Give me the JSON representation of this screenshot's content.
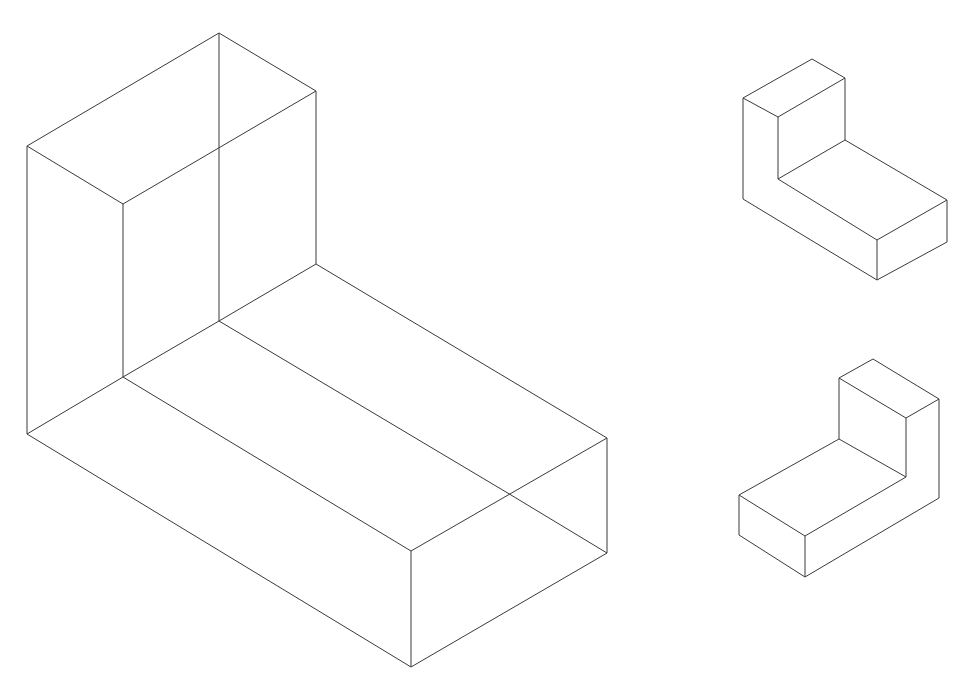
{
  "caption_cut": "",
  "figures": [
    {
      "name": "wireframe-l-block-large",
      "description": "Transparent wireframe of an L-shaped block with all edges visible",
      "lines": [
        [
          219,
          33,
          316,
          91
        ],
        [
          219,
          33,
          27,
          146
        ],
        [
          27,
          146,
          123,
          204
        ],
        [
          123,
          204,
          316,
          91
        ],
        [
          27,
          146,
          27,
          434
        ],
        [
          123,
          204,
          123,
          377
        ],
        [
          219,
          33,
          219,
          321
        ],
        [
          316,
          91,
          316,
          264
        ],
        [
          316,
          264,
          607,
          438
        ],
        [
          219,
          321,
          123,
          377
        ],
        [
          316,
          264,
          219,
          321
        ],
        [
          219,
          321,
          511,
          495
        ],
        [
          123,
          377,
          411,
          551
        ],
        [
          27,
          434,
          123,
          377
        ],
        [
          27,
          434,
          411,
          667
        ],
        [
          411,
          551,
          607,
          438
        ],
        [
          411,
          551,
          411,
          667
        ],
        [
          607,
          438,
          607,
          553
        ],
        [
          607,
          553,
          411,
          667
        ],
        [
          511,
          495,
          607,
          553
        ]
      ]
    },
    {
      "name": "solid-l-block-view-1",
      "description": "Solid isometric L-block, upright part at back left",
      "lines": [
        [
          812,
          59,
          845,
          78
        ],
        [
          812,
          59,
          743,
          98
        ],
        [
          743,
          98,
          778,
          117
        ],
        [
          778,
          117,
          845,
          78
        ],
        [
          743,
          98,
          743,
          199
        ],
        [
          778,
          117,
          778,
          179
        ],
        [
          845,
          78,
          845,
          140
        ],
        [
          845,
          140,
          778,
          179
        ],
        [
          845,
          140,
          947,
          200
        ],
        [
          778,
          179,
          877,
          240
        ],
        [
          947,
          200,
          877,
          240
        ],
        [
          743,
          199,
          877,
          280
        ],
        [
          877,
          240,
          877,
          280
        ],
        [
          947,
          200,
          947,
          242
        ],
        [
          947,
          242,
          877,
          280
        ]
      ]
    },
    {
      "name": "solid-l-block-view-2",
      "description": "Solid isometric L-block, upright part at back right",
      "lines": [
        [
          873,
          359,
          839,
          378
        ],
        [
          873,
          359,
          939,
          399
        ],
        [
          839,
          378,
          906,
          418
        ],
        [
          906,
          418,
          939,
          399
        ],
        [
          839,
          378,
          839,
          439
        ],
        [
          906,
          418,
          906,
          477
        ],
        [
          939,
          399,
          939,
          498
        ],
        [
          839,
          439,
          906,
          477
        ],
        [
          839,
          439,
          739,
          495
        ],
        [
          906,
          477,
          805,
          536
        ],
        [
          739,
          495,
          805,
          536
        ],
        [
          739,
          495,
          739,
          535
        ],
        [
          805,
          536,
          805,
          577
        ],
        [
          739,
          535,
          805,
          577
        ],
        [
          805,
          577,
          939,
          498
        ]
      ]
    }
  ]
}
